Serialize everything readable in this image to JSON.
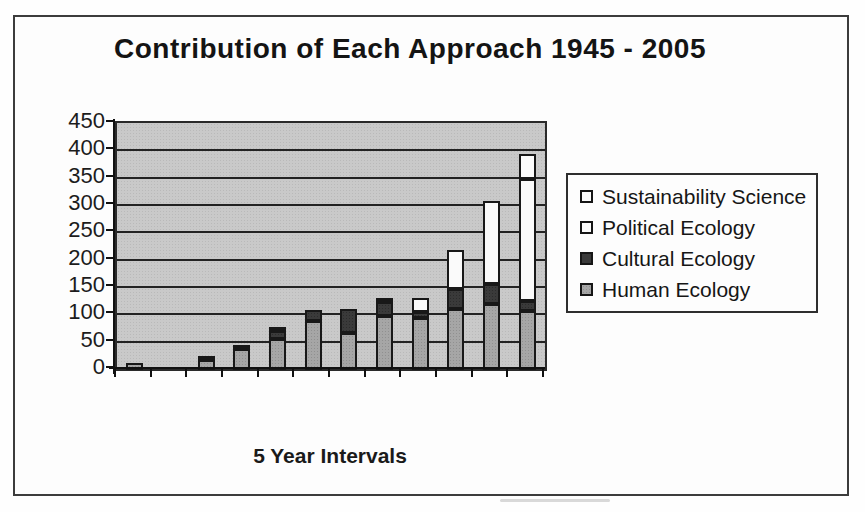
{
  "page": {
    "title": "Contribution of Each Approach 1945 - 2005",
    "x_axis_label": "5 Year Intervals"
  },
  "colors": {
    "plot_background": "#c9c9c9",
    "human_ecology": "#a6a6a6",
    "cultural_ecology": "#3a3a3a",
    "political_ecology": "#fafafa",
    "sustainability_science": "#fcfcfc",
    "gridline": "#232323",
    "frame_border": "#3c3c3c"
  },
  "chart_data": {
    "type": "bar",
    "stacked": true,
    "title": "Contribution of Each Approach 1945 - 2005",
    "xlabel": "5 Year Intervals",
    "ylabel": "",
    "ylim": [
      0,
      450
    ],
    "ytick_interval": 50,
    "yticks": [
      450,
      400,
      350,
      300,
      250,
      200,
      150,
      100,
      50,
      0
    ],
    "grid": true,
    "legend_position": "right",
    "x_tick_labels_visible": false,
    "num_intervals": 12,
    "categories": [
      "",
      "",
      "",
      "",
      "",
      "",
      "",
      "",
      "",
      "",
      "",
      ""
    ],
    "series": [
      {
        "name": "Human Ecology",
        "swatch": "sw-gray",
        "css": "seg-human",
        "values": [
          12,
          0,
          18,
          38,
          57,
          90,
          68,
          98,
          95,
          112,
          120,
          108
        ]
      },
      {
        "name": "Cultural Ecology",
        "swatch": "sw-dark",
        "css": "seg-cultural",
        "values": [
          0,
          0,
          4,
          6,
          15,
          20,
          44,
          26,
          12,
          36,
          38,
          19
        ]
      },
      {
        "name": "Political Ecology",
        "swatch": "sw-white",
        "css": "seg-political",
        "values": [
          0,
          0,
          0,
          0,
          6,
          0,
          0,
          5,
          25,
          72,
          152,
          223
        ]
      },
      {
        "name": "Sustainability Science",
        "swatch": "sw-white",
        "css": "seg-sustain",
        "values": [
          0,
          0,
          0,
          0,
          0,
          0,
          0,
          0,
          0,
          0,
          0,
          45
        ]
      }
    ],
    "legend_order": [
      "Sustainability Science",
      "Political Ecology",
      "Cultural Ecology",
      "Human Ecology"
    ]
  }
}
